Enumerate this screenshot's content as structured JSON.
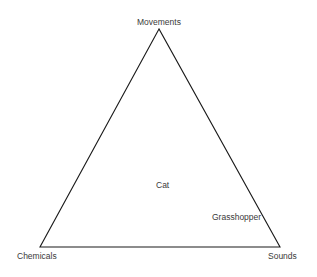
{
  "diagram": {
    "type": "triangle",
    "vertices": [
      {
        "id": "top",
        "label": "Movements",
        "x": 159,
        "y": 29
      },
      {
        "id": "bottom-left",
        "label": "Chemicals",
        "x": 40,
        "y": 247
      },
      {
        "id": "bottom-right",
        "label": "Sounds",
        "x": 280,
        "y": 247
      }
    ],
    "points": [
      {
        "label": "Cat",
        "x": 163,
        "y": 185
      },
      {
        "label": "Grasshopper",
        "x": 237,
        "y": 217
      }
    ],
    "stroke_color": "#1a1a1a",
    "text_color": "#3a3a3a"
  }
}
